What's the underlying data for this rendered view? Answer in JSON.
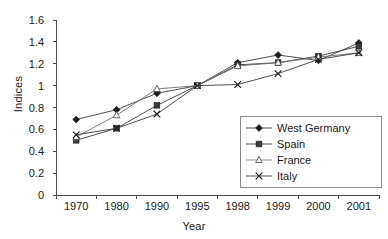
{
  "chart_data": {
    "type": "line",
    "title": "",
    "xlabel": "Year",
    "ylabel": "Indices",
    "categories": [
      "1970",
      "1980",
      "1990",
      "1995",
      "1998",
      "1999",
      "2000",
      "2001"
    ],
    "ylim": [
      0,
      1.6
    ],
    "yticks": [
      "0",
      "0.2",
      "0.4",
      "0.6",
      "0.8",
      "1",
      "1.2",
      "1.4",
      "1.6"
    ],
    "ytick_values": [
      0,
      0.2,
      0.4,
      0.6,
      0.8,
      1.0,
      1.2,
      1.4,
      1.6
    ],
    "grid": false,
    "legend_position": "inside-bottom-right",
    "series": [
      {
        "name": "West Germany",
        "marker": "filled-diamond",
        "color": "#1a1a1a",
        "values": [
          0.69,
          0.78,
          0.93,
          1.0,
          1.21,
          1.28,
          1.23,
          1.39
        ]
      },
      {
        "name": "Spain",
        "marker": "filled-square",
        "color": "#1a1a1a",
        "values": [
          0.5,
          0.61,
          0.82,
          1.0,
          1.19,
          1.21,
          1.27,
          1.36
        ]
      },
      {
        "name": "France",
        "marker": "open-triangle",
        "color": "#1a1a1a",
        "values": [
          0.53,
          0.73,
          0.97,
          1.0,
          1.18,
          1.21,
          1.26,
          1.3
        ]
      },
      {
        "name": "Italy",
        "marker": "cross-x",
        "color": "#1a1a1a",
        "values": [
          0.55,
          0.61,
          0.74,
          1.0,
          1.01,
          1.11,
          1.24,
          1.3
        ]
      }
    ]
  }
}
